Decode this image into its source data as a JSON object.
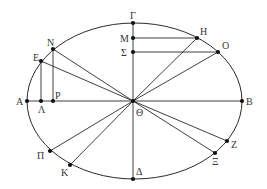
{
  "diagram": {
    "type": "geometric-ellipse-construction",
    "ellipse": {
      "cx": 134.5,
      "cy": 101,
      "rx": 107.5,
      "ry": 78
    },
    "points": [
      {
        "id": "Gamma",
        "label": "Γ",
        "x": 133,
        "y": 23,
        "lx": 130,
        "ly": 19
      },
      {
        "id": "M",
        "label": "Μ",
        "x": 133,
        "y": 38,
        "lx": 120,
        "ly": 42
      },
      {
        "id": "Sigma",
        "label": "Σ",
        "x": 133,
        "y": 52,
        "lx": 121,
        "ly": 56
      },
      {
        "id": "H",
        "label": "Η",
        "x": 197,
        "y": 38,
        "lx": 200,
        "ly": 35
      },
      {
        "id": "O",
        "label": "Ο",
        "x": 218,
        "y": 52,
        "lx": 222,
        "ly": 49
      },
      {
        "id": "N",
        "label": "Ν",
        "x": 53,
        "y": 49,
        "lx": 47,
        "ly": 46
      },
      {
        "id": "E",
        "label": "Ε",
        "x": 41,
        "y": 61,
        "lx": 33,
        "ly": 61
      },
      {
        "id": "A",
        "label": "Α",
        "x": 27,
        "y": 101,
        "lx": 16,
        "ly": 105
      },
      {
        "id": "Lambda",
        "label": "Λ",
        "x": 41,
        "y": 101,
        "lx": 38,
        "ly": 113
      },
      {
        "id": "P",
        "label": "Ρ",
        "x": 53,
        "y": 101,
        "lx": 55,
        "ly": 99
      },
      {
        "id": "Theta",
        "label": "Θ",
        "x": 133,
        "y": 101,
        "lx": 136,
        "ly": 116
      },
      {
        "id": "B",
        "label": "Β",
        "x": 242,
        "y": 101,
        "lx": 246,
        "ly": 105
      },
      {
        "id": "Z",
        "label": "Ζ",
        "x": 227,
        "y": 141,
        "lx": 231,
        "ly": 148
      },
      {
        "id": "Xi",
        "label": "Ξ",
        "x": 215,
        "y": 153,
        "lx": 212,
        "ly": 165
      },
      {
        "id": "Pi",
        "label": "Π",
        "x": 50,
        "y": 151,
        "lx": 37,
        "ly": 159
      },
      {
        "id": "K",
        "label": "Κ",
        "x": 70,
        "y": 165,
        "lx": 61,
        "ly": 176
      },
      {
        "id": "Delta",
        "label": "Δ",
        "x": 133,
        "y": 179,
        "lx": 136,
        "ly": 175
      }
    ],
    "segments": [
      [
        "A",
        "B"
      ],
      [
        "Gamma",
        "Delta"
      ],
      [
        "M",
        "H"
      ],
      [
        "Sigma",
        "O"
      ],
      [
        "H",
        "Theta"
      ],
      [
        "O",
        "Theta"
      ],
      [
        "N",
        "Theta"
      ],
      [
        "E",
        "Theta"
      ],
      [
        "N",
        "P"
      ],
      [
        "E",
        "Lambda"
      ],
      [
        "Theta",
        "Z"
      ],
      [
        "Theta",
        "Xi"
      ],
      [
        "Theta",
        "Pi"
      ],
      [
        "Theta",
        "K"
      ]
    ]
  }
}
